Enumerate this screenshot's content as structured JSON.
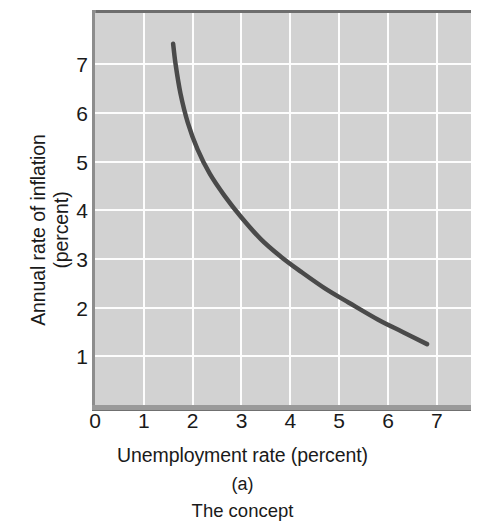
{
  "figure": {
    "panel_letter": "(a)",
    "panel_caption": "The concept",
    "background_color": "#ffffff",
    "plot_background_color": "#d2d2d2",
    "gridline_color": "#fdfdfd",
    "curve_color": "#4a4a4a",
    "axis_shadow_color": "#6e6e6e"
  },
  "chart_data": {
    "type": "line",
    "title": "",
    "subtitle": "",
    "xlabel": "Unemployment rate (percent)",
    "ylabel_line1": "Annual rate of inflation",
    "ylabel_line2": "(percent)",
    "ylabel": "Annual rate of inflation (percent)",
    "xlim": [
      0,
      7.7
    ],
    "ylim": [
      0,
      8.05
    ],
    "xticks": [
      0,
      1,
      2,
      3,
      4,
      5,
      6,
      7
    ],
    "xtick_labels": [
      "0",
      "1",
      "2",
      "3",
      "4",
      "5",
      "6",
      "7"
    ],
    "yticks": [
      1,
      2,
      3,
      4,
      5,
      6,
      7
    ],
    "ytick_labels": [
      "1",
      "2",
      "3",
      "4",
      "5",
      "6",
      "7"
    ],
    "grid": true,
    "grid_axis": "both",
    "legend": null,
    "legend_position": "none",
    "annotations": [],
    "series": [
      {
        "name": "Phillips curve",
        "color": "#4a4a4a",
        "line_width": 4,
        "x": [
          1.6,
          1.65,
          1.75,
          1.9,
          2.1,
          2.35,
          2.65,
          3.0,
          3.4,
          3.8,
          4.2,
          4.7,
          5.2,
          5.8,
          6.3,
          6.8
        ],
        "y": [
          7.42,
          7.0,
          6.4,
          5.8,
          5.25,
          4.75,
          4.3,
          3.85,
          3.4,
          3.05,
          2.75,
          2.4,
          2.1,
          1.75,
          1.5,
          1.25
        ]
      }
    ]
  }
}
